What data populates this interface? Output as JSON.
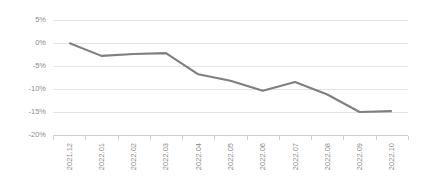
{
  "chart_data": {
    "type": "line",
    "title": "",
    "subtitle": "",
    "xlabel": "",
    "ylabel": "",
    "categories": [
      "2021.12",
      "2022.01",
      "2022.02",
      "2022.03",
      "2022.04",
      "2022.05",
      "2022.06",
      "2022.07",
      "2022.08",
      "2022.09",
      "2022.10"
    ],
    "series": [
      {
        "name": "",
        "values": [
          0.0,
          -2.8,
          -2.4,
          -2.2,
          -6.8,
          -8.2,
          -10.4,
          -8.5,
          -11.2,
          -15.0,
          -14.8
        ]
      }
    ],
    "ylim": [
      -20,
      5
    ],
    "ytick_values": [
      5,
      0,
      -5,
      -10,
      -15,
      -20
    ],
    "ytick_labels": [
      "5%",
      "0%",
      "-5%",
      "-10%",
      "-15%",
      "-20%"
    ],
    "grid": true,
    "legend": "none",
    "value_format": "percent",
    "colors": {
      "line": "#7f7f7f",
      "grid": "#e4e4e4",
      "axis": "#d0d0d0",
      "tick_text": "#8c8c8c",
      "background": "#ffffff"
    },
    "xtick_label_rotation": -90
  },
  "plot_geometry": {
    "left": 53,
    "right": 408,
    "top": 20,
    "bottom": 135
  }
}
